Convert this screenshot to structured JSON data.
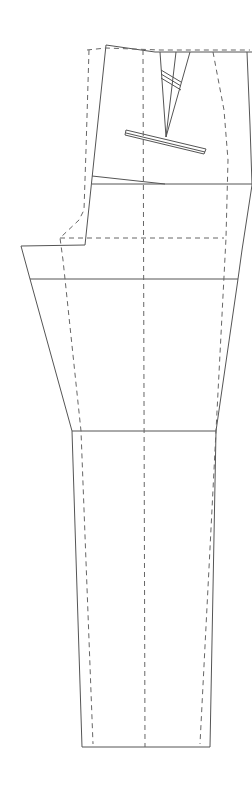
{
  "diagram": {
    "title": "Trouser front pattern draft",
    "colors": {
      "background": "#ffffff",
      "line": "#555555",
      "dashed": "#666666"
    },
    "elements": [
      {
        "name": "waistband-top-line",
        "style": "solid"
      },
      {
        "name": "front-dart",
        "style": "solid"
      },
      {
        "name": "pocket-welt",
        "style": "solid"
      },
      {
        "name": "hip-line",
        "style": "solid"
      },
      {
        "name": "crotch-line",
        "style": "solid"
      },
      {
        "name": "knee-line",
        "style": "solid"
      },
      {
        "name": "hem-line",
        "style": "solid"
      },
      {
        "name": "crease-line",
        "style": "dashed"
      },
      {
        "name": "seam-allowance-outline",
        "style": "dashed"
      }
    ]
  }
}
